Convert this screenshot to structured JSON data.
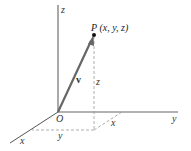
{
  "diagram": {
    "type": "3d-coordinate-vector",
    "axes": {
      "x": {
        "label": "x"
      },
      "y": {
        "label": "y"
      },
      "z": {
        "label": "z"
      }
    },
    "origin": {
      "label": "O"
    },
    "point": {
      "label": "P (x, y, z)"
    },
    "vector": {
      "label": "v"
    },
    "components": {
      "z_height": "z",
      "x_offset": "x",
      "y_offset": "y"
    },
    "colors": {
      "axis": "#555555",
      "vector": "#666666",
      "dashed": "#999999",
      "point": "#111111"
    }
  }
}
